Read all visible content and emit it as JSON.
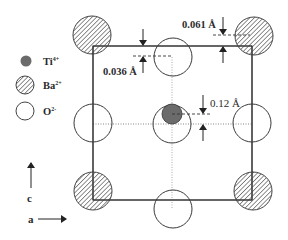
{
  "diagram": {
    "legend": [
      {
        "symbol": "filled-gray-circle",
        "label": "Ti",
        "charge": "4+"
      },
      {
        "symbol": "hatched-circle",
        "label": "Ba",
        "charge": "2+"
      },
      {
        "symbol": "open-circle",
        "label": "O",
        "charge": "2-"
      }
    ],
    "displacements": [
      {
        "label": "0.061 Å",
        "value": "0.061",
        "unit": "Å"
      },
      {
        "label": "0.036 Å",
        "value": "0.036",
        "unit": "Å"
      },
      {
        "label": "0.12 Å",
        "value": "0.12",
        "unit": "Å"
      }
    ],
    "axes": {
      "vertical": "c",
      "horizontal": "a"
    },
    "colors": {
      "ti": "#6b6b6b",
      "stroke": "#3a3a3a",
      "hatch": "#555555"
    }
  }
}
